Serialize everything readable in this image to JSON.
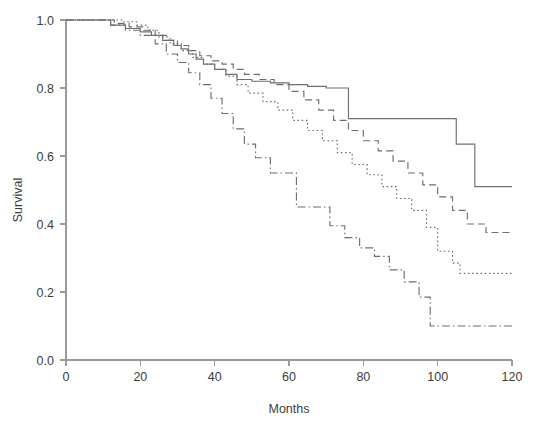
{
  "chart_data": {
    "type": "line",
    "title": "",
    "subtitle": "",
    "xlabel": "Months",
    "ylabel": "Survival",
    "xlim": [
      0,
      120
    ],
    "ylim": [
      0.0,
      1.0
    ],
    "xticks": [
      0,
      20,
      40,
      60,
      80,
      100,
      120
    ],
    "xtick_labels": [
      "0",
      "20",
      "40",
      "60",
      "80",
      "100",
      "120"
    ],
    "yticks": [
      0.0,
      0.2,
      0.4,
      0.6,
      0.8,
      1.0
    ],
    "ytick_labels": [
      "0.0",
      "0.2",
      "0.4",
      "0.6",
      "0.8",
      "1.0"
    ],
    "grid": false,
    "legend": "none",
    "step_type": "post",
    "line_color": "#6f6f6f",
    "background_color": "#ffffff",
    "series": [
      {
        "name": "group-1-solid",
        "linestyle": "solid",
        "dasharray": "",
        "final_value": 0.51,
        "x": [
          0,
          8,
          12,
          16,
          20,
          23,
          26,
          29,
          31,
          33,
          35,
          37,
          40,
          43,
          46,
          50,
          55,
          60,
          65,
          70,
          76,
          94,
          105,
          110,
          120
        ],
        "y": [
          1.0,
          1.0,
          0.985,
          0.975,
          0.965,
          0.955,
          0.94,
          0.925,
          0.915,
          0.9,
          0.885,
          0.87,
          0.855,
          0.84,
          0.825,
          0.82,
          0.815,
          0.81,
          0.805,
          0.8,
          0.71,
          0.71,
          0.635,
          0.51,
          0.51
        ]
      },
      {
        "name": "group-2-dashed",
        "linestyle": "dashed",
        "dasharray": "7,4",
        "final_value": 0.375,
        "x": [
          0,
          9,
          13,
          17,
          21,
          24,
          27,
          30,
          33,
          36,
          39,
          42,
          45,
          48,
          52,
          56,
          60,
          64,
          68,
          72,
          76,
          80,
          84,
          88,
          92,
          96,
          100,
          104,
          108,
          113,
          120
        ],
        "y": [
          1.0,
          1.0,
          0.99,
          0.98,
          0.97,
          0.955,
          0.94,
          0.925,
          0.91,
          0.895,
          0.88,
          0.87,
          0.855,
          0.84,
          0.825,
          0.81,
          0.79,
          0.765,
          0.735,
          0.705,
          0.675,
          0.645,
          0.615,
          0.585,
          0.55,
          0.515,
          0.48,
          0.44,
          0.4,
          0.375,
          0.375
        ]
      },
      {
        "name": "group-3-dotted",
        "linestyle": "dotted",
        "dasharray": "1.6,2.6",
        "final_value": 0.255,
        "x": [
          0,
          10,
          15,
          19,
          22,
          25,
          28,
          31,
          34,
          37,
          40,
          43,
          46,
          49,
          53,
          57,
          61,
          65,
          69,
          73,
          77,
          81,
          85,
          89,
          93,
          97,
          100,
          104,
          106,
          120
        ],
        "y": [
          1.0,
          1.0,
          0.995,
          0.985,
          0.97,
          0.95,
          0.93,
          0.91,
          0.89,
          0.87,
          0.855,
          0.835,
          0.81,
          0.785,
          0.76,
          0.735,
          0.705,
          0.675,
          0.645,
          0.61,
          0.575,
          0.545,
          0.51,
          0.475,
          0.44,
          0.39,
          0.32,
          0.285,
          0.255,
          0.255
        ]
      },
      {
        "name": "group-4-dashdot",
        "linestyle": "dashdot",
        "dasharray": "8,3,1.5,3",
        "final_value": 0.1,
        "x": [
          0,
          8,
          12,
          16,
          20,
          24,
          27,
          30,
          33,
          36,
          39,
          42,
          45,
          48,
          51,
          55,
          62,
          67,
          71,
          75,
          79,
          83,
          87,
          91,
          95,
          98,
          120
        ],
        "y": [
          1.0,
          1.0,
          0.985,
          0.97,
          0.955,
          0.93,
          0.9,
          0.875,
          0.845,
          0.81,
          0.77,
          0.725,
          0.68,
          0.635,
          0.595,
          0.55,
          0.45,
          0.45,
          0.395,
          0.36,
          0.33,
          0.305,
          0.265,
          0.23,
          0.185,
          0.1,
          0.1
        ]
      }
    ]
  },
  "axes": {
    "x_axis_name": "Months",
    "y_axis_name": "Survival"
  }
}
